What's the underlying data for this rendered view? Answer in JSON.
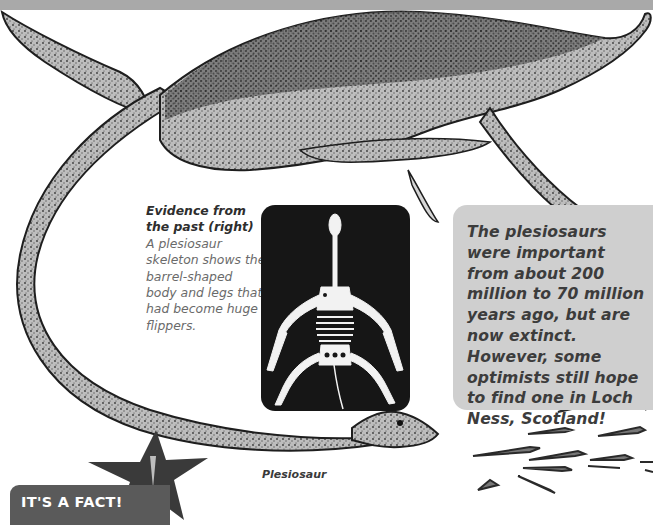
{
  "page": {
    "header_band_color": "#a9a9a9",
    "background_color": "#ffffff"
  },
  "illustration": {
    "subject": "plesiosaur",
    "label": "Plesiosaur",
    "style": "stippled grayscale drawing"
  },
  "caption": {
    "title": "Evidence from the past (right)",
    "body": "A plesiosaur skeleton shows the barrel-shaped body and legs that had become huge flippers."
  },
  "skeleton_panel": {
    "subject": "plesiosaur skeleton",
    "background_color": "#161616"
  },
  "fact_box": {
    "text": "The plesiosaurs were important from about 200 million to 70 million years ago, but are now extinct. However, some optimists still hope to find one in Loch Ness, Scotland!",
    "background_color": "#cfcfcf"
  },
  "badge": {
    "label": "IT'S A FACT!",
    "icon": "exclamation-star-icon",
    "background_color": "#5a5a5a",
    "star_color": "#3a3a3a"
  },
  "decor": {
    "fish_school": "small fish shoal"
  }
}
